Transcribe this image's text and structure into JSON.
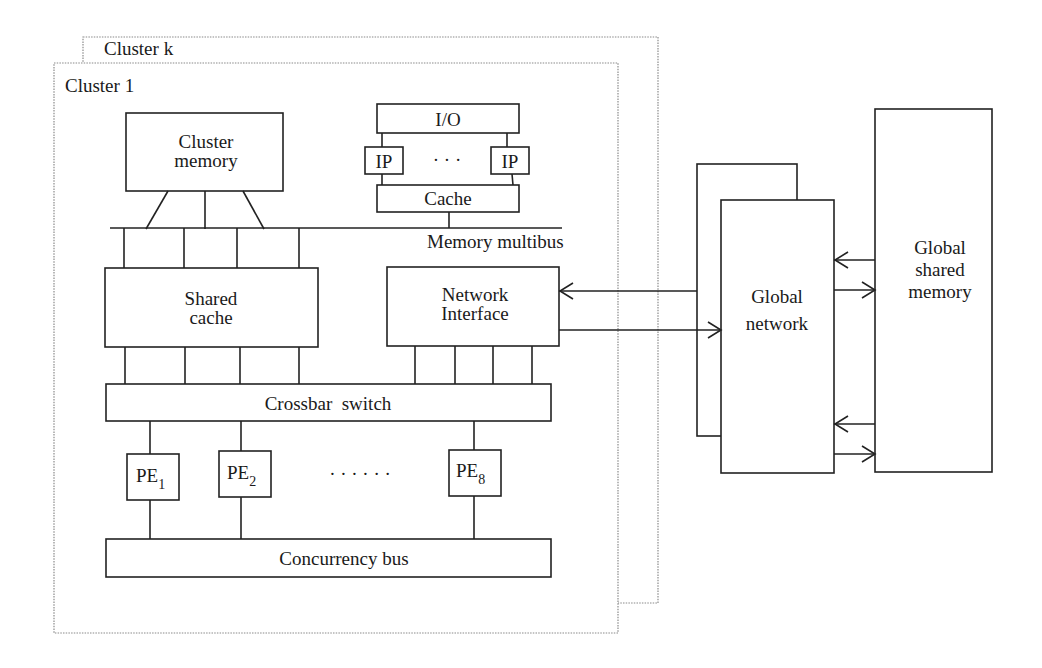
{
  "clusters": {
    "back_label": "Cluster k",
    "front_label": "Cluster 1"
  },
  "cluster_memory": {
    "line1": "Cluster",
    "line2": "memory"
  },
  "io_subsystem": {
    "io_label": "I/O",
    "ip_left": "IP",
    "ip_right": "IP",
    "ellipsis": "· · ·",
    "cache_label": "Cache"
  },
  "memory_multibus": {
    "label": "Memory multibus"
  },
  "shared_cache": {
    "line1": "Shared",
    "line2": "cache"
  },
  "network_interface": {
    "line1": "Network",
    "line2": "Interface"
  },
  "crossbar": {
    "label": "Crossbar  switch"
  },
  "processing_elements": [
    {
      "base": "PE",
      "sub": "1"
    },
    {
      "base": "PE",
      "sub": "2"
    },
    {
      "base": "PE",
      "sub": "8"
    }
  ],
  "pe_ellipsis": "· · · · · ·",
  "concurrency_bus": {
    "label": "Concurrency bus"
  },
  "global_network": {
    "line1": "Global",
    "line2": "network"
  },
  "global_shared_memory": {
    "line1": "Global",
    "line2": "shared",
    "line3": "memory"
  }
}
